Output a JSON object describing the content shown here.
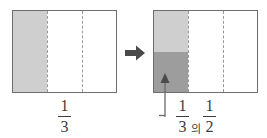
{
  "figure": {
    "type": "fraction-area-model",
    "colors": {
      "outline": "#6e6e6e",
      "dashed_divider": "#9a9a9a",
      "shade_light": "#cfcfcf",
      "shade_dark": "#9d9d9d",
      "background": "#ffffff",
      "text": "#3c3c3c",
      "arrow": "#4a4a4a"
    },
    "left_diagram": {
      "name": "one-third-model",
      "columns": 3,
      "rows": 1,
      "shaded_columns": 1,
      "shade_tone": "light",
      "label": {
        "numerator": "1",
        "denominator": "3",
        "text": "1/3"
      }
    },
    "arrow_between": {
      "icon": "right-arrow-icon",
      "direction": "right"
    },
    "right_diagram": {
      "name": "half-of-one-third-model",
      "columns": 3,
      "rows_in_first_column": 2,
      "top_cell_shade": "light",
      "bottom_cell_shade": "dark",
      "callout": {
        "icon": "up-arrow-icon",
        "points_to": "bottom-left-dark-cell"
      },
      "label": {
        "first_fraction": {
          "numerator": "1",
          "denominator": "3"
        },
        "conjunction": "의",
        "second_fraction": {
          "numerator": "1",
          "denominator": "2"
        },
        "text": "1/3 의 1/2"
      }
    }
  }
}
